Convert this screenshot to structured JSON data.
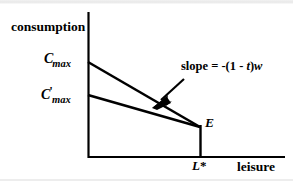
{
  "figure": {
    "type": "economics-budget-constraint-diagram",
    "title_visible": false,
    "axes": {
      "y_label": "consumption",
      "x_label": "leisure",
      "y_axis_x": 88,
      "y_axis_top": 12,
      "y_axis_bottom": 158,
      "x_axis_y": 157,
      "x_axis_left": 88,
      "x_axis_right": 285
    },
    "intercepts": [
      {
        "name": "cmax",
        "base": "C",
        "prime": "",
        "subscript": "max",
        "x": 88,
        "y": 62
      },
      {
        "name": "cmax-prime",
        "base": "C",
        "prime": "'",
        "subscript": "max",
        "x": 88,
        "y": 95
      }
    ],
    "equilibrium": {
      "label": "E",
      "x": 200,
      "y": 127
    },
    "x_tick": {
      "label_base": "L",
      "label_star": "*",
      "x": 200
    },
    "annotation": {
      "text_full": "slope = -(1 - t)w",
      "prefix": "slope = -(1 - ",
      "italic_t": "t",
      "middle": ")",
      "italic_w": "w",
      "arrow_from_x": 184,
      "arrow_from_y": 79,
      "arrow_to_x": 154,
      "arrow_to_y": 106
    },
    "budget_lines": [
      {
        "name": "pre-tax-budget-line",
        "from_x": 88,
        "from_y": 62,
        "to_x": 200,
        "to_y": 127
      },
      {
        "name": "post-tax-budget-line",
        "from_x": 88,
        "from_y": 95,
        "to_x": 200,
        "to_y": 127
      }
    ],
    "drop_line": {
      "name": "equilibrium-drop-line",
      "x": 200,
      "from_y": 127,
      "to_y": 157
    },
    "colors": {
      "ink": "#000000",
      "background": "#ffffff",
      "scan_band": "#ededed"
    }
  }
}
